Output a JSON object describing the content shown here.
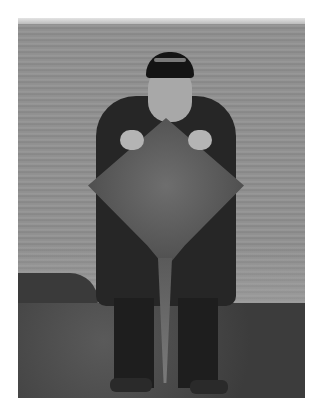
{
  "image": {
    "type": "photograph",
    "color_mode": "grayscale",
    "description": "Man in a dark cap and dark waterproof jacket standing on a grassy clifftop above the sea, holding a large thornback ray up in front of his body with its tail hanging down.",
    "scene": {
      "background": "sea",
      "foreground": "grass clifftop",
      "left_edge": "dark rocks"
    },
    "subject": {
      "person": "man with beard wearing cap and dark jacket",
      "object": "ray fish held by its head, tail hanging down"
    },
    "colors": {
      "page_background": "#ffffff",
      "sea": "#8e8e8e",
      "clothing": "#262626",
      "ray": "#5e5e5e"
    }
  }
}
